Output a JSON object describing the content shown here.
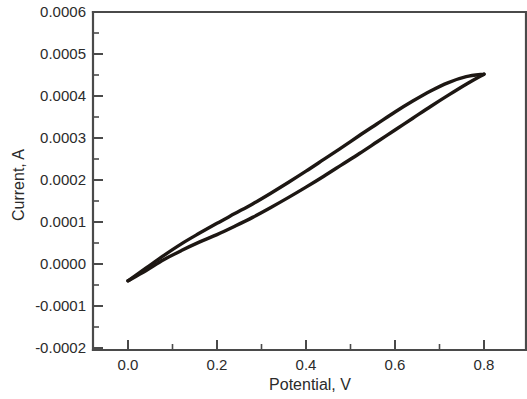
{
  "chart_data": {
    "type": "line",
    "title": "",
    "subtitle": "",
    "xlabel": "Potential, V",
    "ylabel": "Current, A",
    "xlim": [
      -0.08,
      0.93
    ],
    "ylim": [
      -0.0002,
      0.0006
    ],
    "grid": false,
    "legend": null,
    "x_ticks": [
      0.0,
      0.2,
      0.4,
      0.6,
      0.8
    ],
    "x_tick_labels": [
      "0.0",
      "0.2",
      "0.4",
      "0.6",
      "0.8"
    ],
    "x_minor_ticks": [
      0.1,
      0.3,
      0.5,
      0.7
    ],
    "y_ticks": [
      -0.0002,
      -0.0001,
      0.0,
      0.0001,
      0.0002,
      0.0003,
      0.0004,
      0.0005,
      0.0006
    ],
    "y_tick_labels": [
      "-0.0002",
      "-0.0001",
      "0.0000",
      "0.0001",
      "0.0002",
      "0.0003",
      "0.0004",
      "0.0005",
      "0.0006"
    ],
    "y_minor_ticks": [
      -0.00015,
      -5e-05,
      5e-05,
      0.00015,
      0.00025,
      0.00035,
      0.00045,
      0.00055
    ],
    "line_color": "#1d1713",
    "background_color": "#ffffff",
    "frame_color": "#4a4a4a",
    "annotations": [],
    "series": [
      {
        "name": "forward-scan-anodic",
        "description": "Anodic (upper) branch, scan from 0.00 V to 0.80 V",
        "x": [
          0.0,
          0.04,
          0.08,
          0.12,
          0.16,
          0.2,
          0.24,
          0.28,
          0.32,
          0.36,
          0.4,
          0.44,
          0.48,
          0.52,
          0.56,
          0.6,
          0.64,
          0.68,
          0.72,
          0.76,
          0.8
        ],
        "y": [
          -4e-05,
          -1e-05,
          2e-05,
          4.8e-05,
          7.3e-05,
          9.7e-05,
          0.00012,
          0.000143,
          0.000168,
          0.000194,
          0.000221,
          0.000249,
          0.000277,
          0.000306,
          0.000334,
          0.000362,
          0.000388,
          0.000412,
          0.000432,
          0.000446,
          0.000452
        ]
      },
      {
        "name": "reverse-scan-cathodic",
        "description": "Cathodic (lower) branch, scan from 0.80 V back to 0.00 V",
        "x": [
          0.8,
          0.76,
          0.72,
          0.68,
          0.64,
          0.6,
          0.56,
          0.52,
          0.48,
          0.44,
          0.4,
          0.36,
          0.32,
          0.28,
          0.24,
          0.2,
          0.16,
          0.12,
          0.08,
          0.04,
          0.0
        ],
        "y": [
          0.000452,
          0.000428,
          0.000402,
          0.000375,
          0.000347,
          0.000319,
          0.000291,
          0.000263,
          0.000236,
          0.000209,
          0.000183,
          0.000158,
          0.000134,
          0.000111,
          9e-05,
          7e-05,
          5.2e-05,
          3.2e-05,
          1e-05,
          -1.6e-05,
          -4e-05
        ]
      }
    ],
    "notable_points": {
      "upper_vertex_label": "0.80 V, 0.00045 A",
      "lower_vertex_label": "0.00 V, -0.00004 A"
    }
  }
}
